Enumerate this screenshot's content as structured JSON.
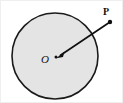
{
  "figure": {
    "type": "geometry-diagram",
    "canvas": {
      "width": 123,
      "height": 103,
      "background": "#ffffff"
    },
    "frame": {
      "visible": true,
      "color": "#efefef"
    },
    "circle": {
      "name": "circle",
      "center_x": 55,
      "center_y": 56,
      "radius": 43,
      "fill": "#e4e4e4",
      "stroke": "#1a1a1a",
      "stroke_width": 1.6
    },
    "center_point": {
      "label": "O",
      "x": 55,
      "y": 56,
      "label_x": 47,
      "label_y": 62
    },
    "outer_point": {
      "label": "P",
      "x": 110,
      "y": 22,
      "dot_radius": 2.2,
      "label_x": 104,
      "label_y": 14
    },
    "vector": {
      "name": "vector-p-to-o",
      "from_x": 110,
      "from_y": 22,
      "to_x": 58,
      "to_y": 57,
      "stroke": "#101010",
      "stroke_width": 1.7,
      "arrow_at": "O",
      "arrow_size": 7
    }
  }
}
